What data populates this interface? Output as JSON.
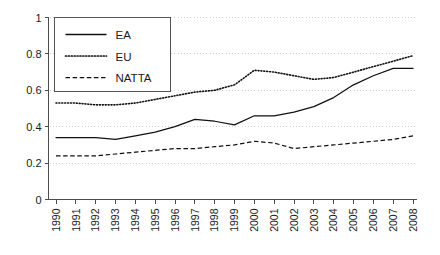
{
  "chart_data": {
    "type": "line",
    "title": "",
    "xlabel": "",
    "ylabel": "",
    "xlim": [
      1990,
      2008
    ],
    "ylim": [
      0,
      1
    ],
    "grid": true,
    "legend_position": "top-left",
    "y_ticks": [
      "0",
      "0.2",
      "0.4",
      "0.6",
      "0.8",
      "1"
    ],
    "y_tick_values": [
      0,
      0.2,
      0.4,
      0.6,
      0.8,
      1
    ],
    "categories": [
      "1990",
      "1991",
      "1992",
      "1993",
      "1994",
      "1995",
      "1996",
      "1997",
      "1998",
      "1999",
      "2000",
      "2001",
      "2002",
      "2003",
      "2004",
      "2005",
      "2006",
      "2007",
      "2008"
    ],
    "series": [
      {
        "name": "EA",
        "style": "solid",
        "color": "#111111",
        "values": [
          0.34,
          0.34,
          0.34,
          0.33,
          0.35,
          0.37,
          0.4,
          0.44,
          0.43,
          0.41,
          0.46,
          0.46,
          0.48,
          0.51,
          0.56,
          0.63,
          0.68,
          0.72,
          0.72
        ]
      },
      {
        "name": "EU",
        "style": "dotted",
        "color": "#111111",
        "values": [
          0.53,
          0.53,
          0.52,
          0.52,
          0.53,
          0.55,
          0.57,
          0.59,
          0.6,
          0.63,
          0.71,
          0.7,
          0.68,
          0.66,
          0.67,
          0.7,
          0.73,
          0.76,
          0.79
        ]
      },
      {
        "name": "NATTA",
        "style": "dashed",
        "color": "#111111",
        "values": [
          0.24,
          0.24,
          0.24,
          0.25,
          0.26,
          0.27,
          0.28,
          0.28,
          0.29,
          0.3,
          0.32,
          0.31,
          0.28,
          0.29,
          0.3,
          0.31,
          0.32,
          0.33,
          0.35
        ]
      }
    ]
  },
  "legend": {
    "entries": [
      {
        "label": "EA"
      },
      {
        "label": "EU"
      },
      {
        "label": "NATTA"
      }
    ]
  }
}
